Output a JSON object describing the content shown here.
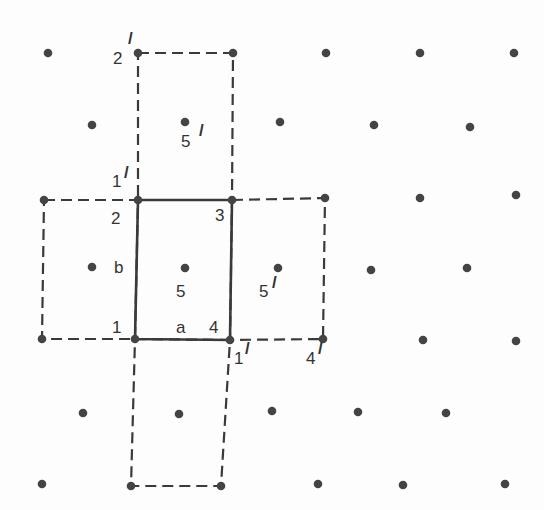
{
  "diagram": {
    "dot_color": "#444444",
    "line_color": "#3a3a3a",
    "dots": [
      [
        48,
        53
      ],
      [
        138,
        53
      ],
      [
        233,
        53
      ],
      [
        326,
        53
      ],
      [
        420,
        53
      ],
      [
        514,
        53
      ],
      [
        92,
        125
      ],
      [
        185,
        122
      ],
      [
        280,
        122
      ],
      [
        374,
        125
      ],
      [
        470,
        127
      ],
      [
        44,
        200
      ],
      [
        138,
        200
      ],
      [
        232,
        200
      ],
      [
        325,
        198
      ],
      [
        420,
        198
      ],
      [
        516,
        195
      ],
      [
        92,
        267
      ],
      [
        185,
        268
      ],
      [
        278,
        268
      ],
      [
        371,
        270
      ],
      [
        467,
        268
      ],
      [
        42,
        339
      ],
      [
        135,
        339
      ],
      [
        230,
        340
      ],
      [
        323,
        339
      ],
      [
        423,
        340
      ],
      [
        516,
        341
      ],
      [
        83,
        413
      ],
      [
        179,
        414
      ],
      [
        272,
        411
      ],
      [
        358,
        412
      ],
      [
        446,
        413
      ],
      [
        42,
        484
      ],
      [
        131,
        486
      ],
      [
        221,
        486
      ],
      [
        318,
        484
      ],
      [
        403,
        485
      ],
      [
        505,
        484
      ]
    ],
    "solid_cell": [
      [
        138,
        200
      ],
      [
        232,
        200
      ],
      [
        230,
        340
      ],
      [
        135,
        339
      ]
    ],
    "dashed_cells": [
      [
        [
          138,
          53
        ],
        [
          233,
          53
        ],
        [
          232,
          200
        ],
        [
          138,
          200
        ]
      ],
      [
        [
          44,
          200
        ],
        [
          138,
          200
        ],
        [
          135,
          339
        ],
        [
          42,
          339
        ]
      ],
      [
        [
          232,
          200
        ],
        [
          325,
          198
        ],
        [
          323,
          339
        ],
        [
          230,
          340
        ]
      ],
      [
        [
          135,
          339
        ],
        [
          230,
          340
        ],
        [
          221,
          486
        ],
        [
          131,
          486
        ]
      ]
    ],
    "labels": [
      {
        "text": "2",
        "x": 113,
        "y": 64
      },
      {
        "text": "/",
        "x": 128,
        "y": 44
      },
      {
        "text": "5",
        "x": 181,
        "y": 147
      },
      {
        "text": "/",
        "x": 199,
        "y": 136
      },
      {
        "text": "1",
        "x": 112,
        "y": 187
      },
      {
        "text": "/",
        "x": 124,
        "y": 178
      },
      {
        "text": "2",
        "x": 111,
        "y": 224
      },
      {
        "text": "3",
        "x": 215,
        "y": 221
      },
      {
        "text": "b",
        "x": 114,
        "y": 273
      },
      {
        "text": "5",
        "x": 176,
        "y": 297
      },
      {
        "text": "5",
        "x": 259,
        "y": 297
      },
      {
        "text": "/",
        "x": 272,
        "y": 288
      },
      {
        "text": "1",
        "x": 112,
        "y": 333
      },
      {
        "text": "a",
        "x": 176,
        "y": 333
      },
      {
        "text": "4",
        "x": 209,
        "y": 333
      },
      {
        "text": "1",
        "x": 234,
        "y": 364
      },
      {
        "text": "/",
        "x": 245,
        "y": 354
      },
      {
        "text": "4",
        "x": 306,
        "y": 364
      },
      {
        "text": "/",
        "x": 318,
        "y": 354
      }
    ]
  }
}
